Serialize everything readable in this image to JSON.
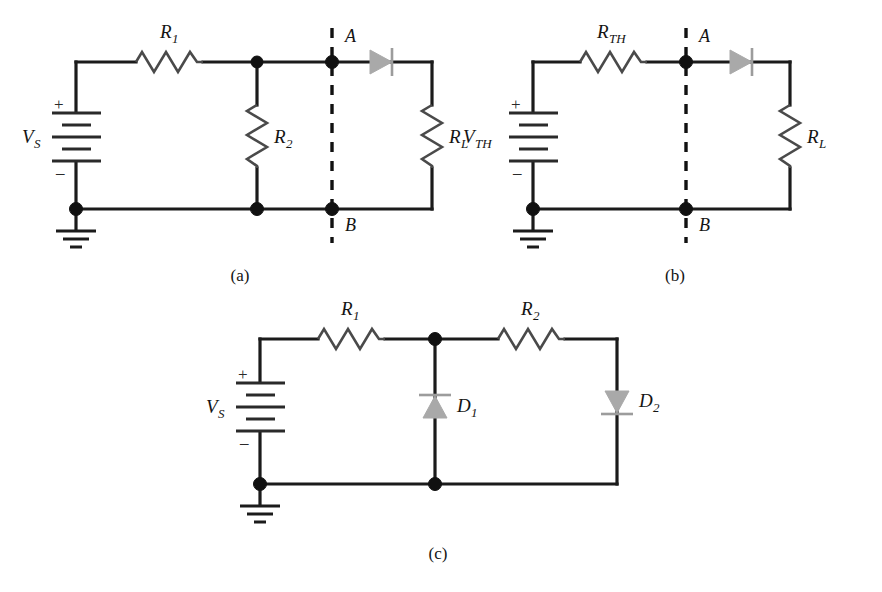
{
  "figure": {
    "background_color": "#ffffff",
    "line_color": "#1b1b1b",
    "diode_fill_color": "#a9a9a9",
    "resistor_color": "#4a4a4a",
    "width": 882,
    "height": 592
  },
  "panels": [
    {
      "id": "a",
      "caption": "(a)",
      "source_label": "V",
      "source_subscript": "S",
      "plus_sign": "+",
      "minus_sign": "–",
      "components": [
        {
          "name": "resistor-r1",
          "label": "R",
          "subscript": "1",
          "orientation": "horizontal"
        },
        {
          "name": "resistor-r2",
          "label": "R",
          "subscript": "2",
          "orientation": "vertical"
        },
        {
          "name": "resistor-rl",
          "label": "R",
          "subscript": "L",
          "orientation": "vertical"
        },
        {
          "name": "diode",
          "label": "",
          "subscript": "",
          "orientation": "right"
        }
      ],
      "terminals": [
        {
          "name": "terminal-a",
          "label": "A"
        },
        {
          "name": "terminal-b",
          "label": "B"
        }
      ],
      "ground": "ground-symbol"
    },
    {
      "id": "b",
      "caption": "(b)",
      "source_label": "V",
      "source_subscript": "TH",
      "plus_sign": "+",
      "minus_sign": "–",
      "components": [
        {
          "name": "resistor-rth",
          "label": "R",
          "subscript": "TH",
          "orientation": "horizontal"
        },
        {
          "name": "resistor-rl",
          "label": "R",
          "subscript": "L",
          "orientation": "vertical"
        },
        {
          "name": "diode",
          "label": "",
          "subscript": "",
          "orientation": "right"
        }
      ],
      "terminals": [
        {
          "name": "terminal-a",
          "label": "A"
        },
        {
          "name": "terminal-b",
          "label": "B"
        }
      ],
      "ground": "ground-symbol"
    },
    {
      "id": "c",
      "caption": "(c)",
      "source_label": "V",
      "source_subscript": "S",
      "plus_sign": "+",
      "minus_sign": "–",
      "components": [
        {
          "name": "resistor-r1",
          "label": "R",
          "subscript": "1",
          "orientation": "horizontal"
        },
        {
          "name": "resistor-r2",
          "label": "R",
          "subscript": "2",
          "orientation": "horizontal"
        },
        {
          "name": "diode-d1",
          "label": "D",
          "subscript": "1",
          "orientation": "up"
        },
        {
          "name": "diode-d2",
          "label": "D",
          "subscript": "2",
          "orientation": "down"
        }
      ],
      "terminals": [],
      "ground": "ground-symbol"
    }
  ]
}
